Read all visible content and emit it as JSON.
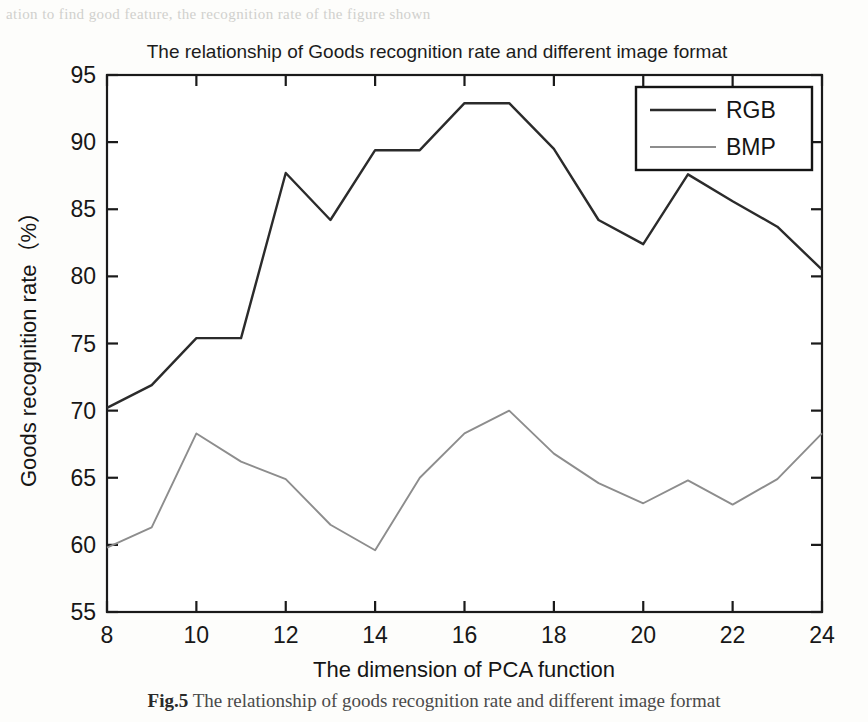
{
  "page": {
    "ghost_top_text": "ation to find   good feature, the recognition  rate of the figure shown",
    "ghost_left_text": "",
    "ghost_right_text": "",
    "caption_label": "Fig.5",
    "caption_text": "The relationship of goods recognition rate and different image format"
  },
  "chart_data": {
    "type": "line",
    "title": "The relationship of Goods recognition rate and different image format",
    "xlabel": "The dimension of PCA function",
    "ylabel": "Goods recognition rate（%）",
    "xlim": [
      8,
      24
    ],
    "ylim": [
      55,
      95
    ],
    "xticks": [
      8,
      10,
      12,
      14,
      16,
      18,
      20,
      22,
      24
    ],
    "yticks": [
      55,
      60,
      65,
      70,
      75,
      80,
      85,
      90,
      95
    ],
    "xtick_labels": [
      "8",
      "10",
      "12",
      "14",
      "16",
      "18",
      "20",
      "22",
      "24"
    ],
    "ytick_labels": [
      "55",
      "60",
      "65",
      "70",
      "75",
      "80",
      "85",
      "90",
      "95"
    ],
    "grid": false,
    "legend_position": "upper right",
    "x": [
      8,
      9,
      10,
      11,
      12,
      13,
      14,
      15,
      16,
      17,
      18,
      19,
      20,
      21,
      22,
      23,
      24
    ],
    "series": [
      {
        "name": "RGB",
        "color": "#2b2b2b",
        "values": [
          70.2,
          71.9,
          75.4,
          75.4,
          87.7,
          84.2,
          89.4,
          89.4,
          92.9,
          92.9,
          89.5,
          84.2,
          82.4,
          87.6,
          85.6,
          83.7,
          80.5
        ]
      },
      {
        "name": "BMP",
        "color": "#8d8d8d",
        "values": [
          59.8,
          61.3,
          68.3,
          66.2,
          64.9,
          61.5,
          59.6,
          65.0,
          68.3,
          70.0,
          66.8,
          64.6,
          63.1,
          64.8,
          63.0,
          64.9,
          68.3
        ]
      }
    ]
  }
}
